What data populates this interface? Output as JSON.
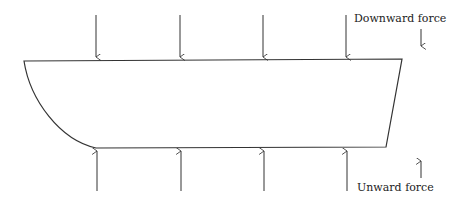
{
  "diagram": {
    "labels": {
      "downward": "Downward force",
      "upward": "Unward force"
    },
    "colors": {
      "stroke": "#333333",
      "background": "#ffffff"
    },
    "down_arrows_x": [
      96,
      180,
      263,
      346
    ],
    "up_arrows_x": [
      97,
      181,
      264,
      347
    ]
  }
}
